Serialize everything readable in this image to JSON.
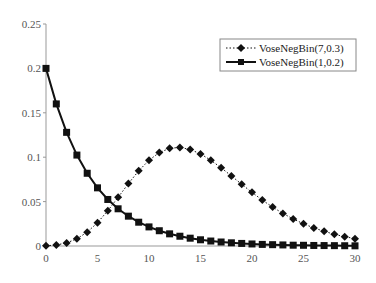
{
  "chart_data": {
    "type": "line",
    "title": "",
    "xlabel": "",
    "ylabel": "",
    "xlim": [
      0,
      30
    ],
    "ylim": [
      0,
      0.25
    ],
    "grid": false,
    "legend_position": "upper right",
    "x_ticks": [
      "0",
      "5",
      "10",
      "15",
      "20",
      "25",
      "30"
    ],
    "y_ticks": [
      "0",
      "0.05",
      "0.1",
      "0.15",
      "0.2",
      "0.25"
    ],
    "x": [
      0,
      1,
      2,
      3,
      4,
      5,
      6,
      7,
      8,
      9,
      10,
      11,
      12,
      13,
      14,
      15,
      16,
      17,
      18,
      19,
      20,
      21,
      22,
      23,
      24,
      25,
      26,
      27,
      28,
      29,
      30
    ],
    "series": [
      {
        "name": "VoseNegBin(7,0.3)",
        "marker": "diamond",
        "line": "dotted",
        "color": "#111111",
        "values": [
          0.0002,
          0.0011,
          0.0035,
          0.0081,
          0.0156,
          0.0262,
          0.0397,
          0.0548,
          0.0703,
          0.0847,
          0.0966,
          0.1052,
          0.11,
          0.111,
          0.1087,
          0.1037,
          0.0966,
          0.0881,
          0.0789,
          0.0695,
          0.0604,
          0.0517,
          0.0438,
          0.0367,
          0.0304,
          0.025,
          0.0204,
          0.0165,
          0.0132,
          0.0105,
          0.0083
        ]
      },
      {
        "name": "VoseNegBin(1,0.2)",
        "marker": "square",
        "line": "solid",
        "color": "#111111",
        "values": [
          0.2,
          0.16,
          0.128,
          0.1024,
          0.0819,
          0.0655,
          0.0524,
          0.0419,
          0.0336,
          0.0268,
          0.0215,
          0.0172,
          0.0137,
          0.011,
          0.0088,
          0.007,
          0.0056,
          0.0045,
          0.0036,
          0.0029,
          0.0023,
          0.0018,
          0.0015,
          0.0012,
          0.0009,
          0.0008,
          0.0006,
          0.0005,
          0.0004,
          0.0003,
          0.0002
        ]
      }
    ]
  },
  "legend": {
    "items": [
      "VoseNegBin(7,0.3)",
      "VoseNegBin(1,0.2)"
    ]
  }
}
